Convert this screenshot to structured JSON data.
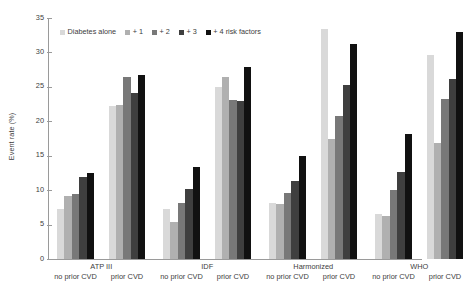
{
  "chart_data": {
    "type": "bar",
    "title": "",
    "xlabel": "",
    "ylabel": "Event rate (%)",
    "ylim": [
      0,
      35
    ],
    "yticks": [
      0,
      5,
      10,
      15,
      20,
      25,
      30,
      35
    ],
    "ytick_labels": [
      "0",
      "5",
      "10",
      "15",
      "20",
      "25",
      "30",
      "35"
    ],
    "grid": false,
    "legend_position": "top-left",
    "series": [
      {
        "name": "Diabetes alone",
        "color": "#d9d9d9",
        "values": [
          7.3,
          22.2,
          7.2,
          25.0,
          8.1,
          33.4,
          6.6,
          29.6
        ]
      },
      {
        "name": "+ 1",
        "color": "#b0b0b0",
        "values": [
          9.2,
          22.4,
          5.4,
          26.4,
          8.0,
          17.5,
          6.3,
          16.9
        ]
      },
      {
        "name": "+ 2",
        "color": "#787878",
        "values": [
          9.5,
          26.4,
          8.2,
          23.1,
          9.6,
          20.8,
          10.0,
          23.3
        ]
      },
      {
        "name": "+ 3",
        "color": "#3f3f3f",
        "values": [
          11.9,
          24.1,
          10.2,
          23.0,
          11.3,
          25.2,
          12.7,
          26.2
        ]
      },
      {
        "name": "+ 4 risk factors",
        "color": "#111111",
        "values": [
          12.5,
          26.7,
          13.4,
          27.9,
          15.0,
          31.2,
          18.1,
          32.9
        ]
      }
    ],
    "groups": [
      {
        "label": "ATP III",
        "subgroups": [
          "no prior CVD",
          "prior CVD"
        ]
      },
      {
        "label": "IDF",
        "subgroups": [
          "no prior CVD",
          "prior CVD"
        ]
      },
      {
        "label": "Harmonized",
        "subgroups": [
          "no prior CVD",
          "prior CVD"
        ]
      },
      {
        "label": "WHO",
        "subgroups": [
          "no prior CVD",
          "prior CVD"
        ]
      }
    ],
    "categories": [
      "ATP III no prior CVD",
      "ATP III prior CVD",
      "IDF no prior CVD",
      "IDF prior CVD",
      "Harmonized no prior CVD",
      "Harmonized prior CVD",
      "WHO no prior CVD",
      "WHO prior CVD"
    ]
  },
  "axis": {
    "ylabel": "Event rate (%)"
  }
}
